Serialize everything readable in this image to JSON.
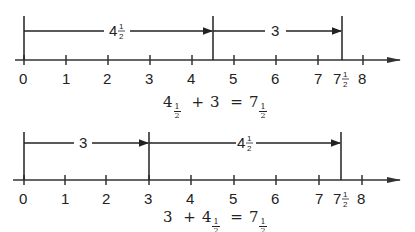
{
  "diagrams": [
    {
      "id": "top",
      "axis": {
        "min": 0,
        "max": 8,
        "tick_labels": [
          "0",
          "1",
          "2",
          "3",
          "4",
          "5",
          "6",
          "7",
          "8"
        ],
        "extra_tick": "7½"
      },
      "segments": [
        {
          "from": 0,
          "to": 4.5,
          "label_whole": "4",
          "label_num": "1",
          "label_den": "2"
        },
        {
          "from": 4.5,
          "to": 7.5,
          "label_whole": "3",
          "label_num": "",
          "label_den": ""
        }
      ],
      "equation": {
        "a_whole": "4",
        "a_num": "1",
        "a_den": "2",
        "op": "+",
        "b": "3",
        "eq": "=",
        "r_whole": "7",
        "r_num": "1",
        "r_den": "2"
      }
    },
    {
      "id": "bottom",
      "axis": {
        "min": 0,
        "max": 8,
        "tick_labels": [
          "0",
          "1",
          "2",
          "3",
          "4",
          "5",
          "6",
          "7",
          "8"
        ],
        "extra_tick": "7½"
      },
      "segments": [
        {
          "from": 0,
          "to": 3,
          "label_whole": "3",
          "label_num": "",
          "label_den": ""
        },
        {
          "from": 3,
          "to": 7.5,
          "label_whole": "4",
          "label_num": "1",
          "label_den": "2"
        }
      ],
      "equation": {
        "a": "3",
        "op": "+",
        "b_whole": "4",
        "b_num": "1",
        "b_den": "2",
        "eq": "=",
        "r_whole": "7",
        "r_num": "1",
        "r_den": "2"
      }
    }
  ],
  "labels": {
    "t0": "0",
    "t1": "1",
    "t2": "2",
    "t3": "3",
    "t4": "4",
    "t5": "5",
    "t6": "6",
    "t7": "7",
    "t8": "8",
    "seven": "7",
    "half_num": "1",
    "half_den": "2",
    "four": "4",
    "three": "3"
  }
}
